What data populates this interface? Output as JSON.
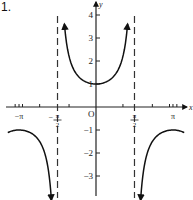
{
  "problem": {
    "number": "1."
  },
  "chart_data": {
    "type": "line",
    "title": "",
    "function": "y = sec x",
    "xlabel": "x",
    "ylabel": "y",
    "xlim": [
      -3.6,
      3.95
    ],
    "ylim": [
      -3.9,
      4.65
    ],
    "grid": false,
    "x_tick_labels": [
      {
        "value": -3.14159,
        "label": "−π"
      },
      {
        "value": -1.5708,
        "label": "−π/2"
      },
      {
        "value": 0,
        "label": "O"
      },
      {
        "value": 1.5708,
        "label": "π/2"
      },
      {
        "value": 3.14159,
        "label": "π"
      }
    ],
    "x_minor_ticks": [
      -3.3,
      -3.0,
      -2.3,
      -1.1,
      1.1,
      2.3,
      3.0,
      3.3
    ],
    "y_tick_labels": [
      {
        "value": 4,
        "label": "4"
      },
      {
        "value": 3,
        "label": "3"
      },
      {
        "value": 2,
        "label": "2"
      },
      {
        "value": 1,
        "label": "1"
      },
      {
        "value": -1,
        "label": "−1"
      },
      {
        "value": -2,
        "label": "−2"
      },
      {
        "value": -3,
        "label": "−3"
      }
    ],
    "asymptotes": [
      {
        "x": -1.5708,
        "label": "x = −π/2",
        "style": "dashed"
      },
      {
        "x": 1.5708,
        "label": "x = π/2",
        "style": "dashed"
      }
    ],
    "series": [
      {
        "name": "left-branch",
        "domain": [
          -3.6,
          -1.82
        ],
        "key_points": [
          {
            "x": -3.14159,
            "y": -1
          }
        ],
        "arrow_end": "down"
      },
      {
        "name": "center-branch",
        "domain": [
          -1.29,
          1.29
        ],
        "key_points": [
          {
            "x": 0,
            "y": 1
          }
        ],
        "arrow_ends": [
          "up",
          "up"
        ]
      },
      {
        "name": "right-branch",
        "domain": [
          1.82,
          3.6
        ],
        "key_points": [
          {
            "x": 3.14159,
            "y": -1
          }
        ],
        "arrow_end": "down"
      }
    ],
    "layout": {
      "origin_px": [
        96,
        107
      ],
      "px_per_x_unit": 24.5,
      "px_per_y_unit": 23
    }
  }
}
